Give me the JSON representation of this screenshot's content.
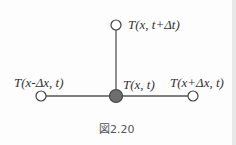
{
  "figure": {
    "caption": "図2.20",
    "nodes": [
      {
        "id": "top",
        "label": "T(x, t+Δt)",
        "filled": false
      },
      {
        "id": "left",
        "label": "T(x-Δx, t)",
        "filled": false
      },
      {
        "id": "center",
        "label": "T(x, t)",
        "filled": true
      },
      {
        "id": "right",
        "label": "T(x+Δx, t)",
        "filled": false
      }
    ],
    "edges": [
      [
        "center",
        "top"
      ],
      [
        "center",
        "left"
      ],
      [
        "center",
        "right"
      ]
    ],
    "colors": {
      "line": "#555555",
      "filled_node": "#6e6e6e",
      "open_node": "#ffffff"
    }
  }
}
